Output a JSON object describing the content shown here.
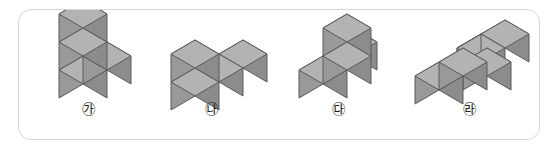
{
  "panel": {
    "border_color": "#d6d6d6",
    "background_color": "#ffffff",
    "shape": "rounded-rectangle"
  },
  "cube_style": {
    "top_face_color": "#b3b3b3",
    "front_face_color": "#999999",
    "side_face_color": "#8c8c8c",
    "edge_color": "#5a5a5a",
    "projection": "isometric"
  },
  "figures": [
    {
      "label": "㉮",
      "label_text": "가",
      "cube_count": 4,
      "description": "vertical column of three cubes with one cube attached to the right at the middle level",
      "cells": [
        {
          "x": 0,
          "y": 0,
          "z": 0
        },
        {
          "x": 0,
          "y": 0,
          "z": 1
        },
        {
          "x": 0,
          "y": 0,
          "z": 2
        },
        {
          "x": 1,
          "y": 0,
          "z": 1
        }
      ]
    },
    {
      "label": "㉯",
      "label_text": "나",
      "cube_count": 4,
      "description": "two-cube vertical stack on the left with two cubes extending to the right on the bottom level",
      "cells": [
        {
          "x": 0,
          "y": 0,
          "z": 0
        },
        {
          "x": 0,
          "y": 0,
          "z": 1
        },
        {
          "x": 1,
          "y": 0,
          "z": 0
        },
        {
          "x": 2,
          "y": 0,
          "z": 0
        }
      ]
    },
    {
      "label": "㉰",
      "label_text": "다",
      "cube_count": 4,
      "description": "bottom row of two cubes with one cube stacked on the right forming a step",
      "cells": [
        {
          "x": 0,
          "y": 0,
          "z": 0
        },
        {
          "x": 1,
          "y": 0,
          "z": 0
        },
        {
          "x": 1,
          "y": 1,
          "z": 0
        },
        {
          "x": 1,
          "y": 0,
          "z": 1
        }
      ]
    },
    {
      "label": "㉱",
      "label_text": "라",
      "cube_count": 4,
      "description": "flat S-shaped arrangement of four cubes lying on one level",
      "cells": [
        {
          "x": 0,
          "y": 1,
          "z": 0
        },
        {
          "x": 1,
          "y": 1,
          "z": 0
        },
        {
          "x": 1,
          "y": 0,
          "z": 0
        },
        {
          "x": 2,
          "y": 0,
          "z": 0
        }
      ]
    }
  ]
}
